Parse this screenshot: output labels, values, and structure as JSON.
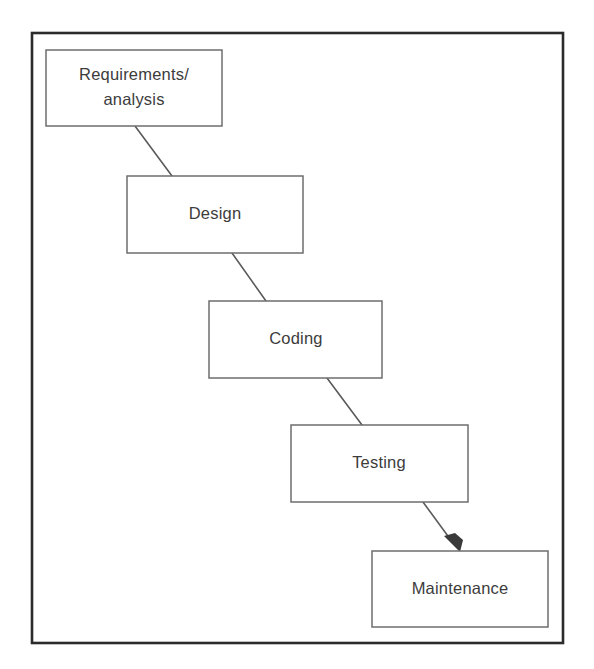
{
  "diagram": {
    "type": "waterfall-model-flow",
    "frame": {
      "name": "diagram-border",
      "x": 32,
      "y": 33,
      "width": 531,
      "height": 610,
      "border_color": "#2b2b2b",
      "background_color": "#ffffff"
    },
    "style": {
      "box_stroke_color": "#6e6e6e",
      "box_fill_color": "#ffffff",
      "connector_color": "#5a5a5a",
      "arrow_color": "#3a3a3a",
      "text_color": "#3c3c3c"
    },
    "stages": [
      {
        "id": "requirements",
        "label_lines": [
          "Requirements/",
          "analysis"
        ],
        "label": "Requirements/ analysis",
        "order": 1,
        "x": 46,
        "y": 50,
        "width": 176,
        "height": 76
      },
      {
        "id": "design",
        "label_lines": [
          "Design"
        ],
        "label": "Design",
        "order": 2,
        "x": 127,
        "y": 176,
        "width": 176,
        "height": 77
      },
      {
        "id": "coding",
        "label_lines": [
          "Coding"
        ],
        "label": "Coding",
        "order": 3,
        "x": 209,
        "y": 301,
        "width": 173,
        "height": 77
      },
      {
        "id": "testing",
        "label_lines": [
          "Testing"
        ],
        "label": "Testing",
        "order": 4,
        "x": 291,
        "y": 425,
        "width": 177,
        "height": 77
      },
      {
        "id": "maintenance",
        "label_lines": [
          "Maintenance"
        ],
        "label": "Maintenance",
        "order": 5,
        "x": 372,
        "y": 551,
        "width": 176,
        "height": 76
      }
    ],
    "connectors": [
      {
        "id": "requirements-to-design",
        "from": "requirements",
        "to": "design",
        "x1": 135,
        "y1": 126,
        "x2": 172,
        "y2": 176,
        "arrowhead": false
      },
      {
        "id": "design-to-coding",
        "from": "design",
        "to": "coding",
        "x1": 232,
        "y1": 253,
        "x2": 266,
        "y2": 301,
        "arrowhead": false
      },
      {
        "id": "coding-to-testing",
        "from": "coding",
        "to": "testing",
        "x1": 327,
        "y1": 378,
        "x2": 362,
        "y2": 425,
        "arrowhead": false
      },
      {
        "id": "testing-to-maintenance",
        "from": "testing",
        "to": "maintenance",
        "x1": 423,
        "y1": 502,
        "x2": 459,
        "y2": 551,
        "arrowhead": true
      }
    ]
  }
}
